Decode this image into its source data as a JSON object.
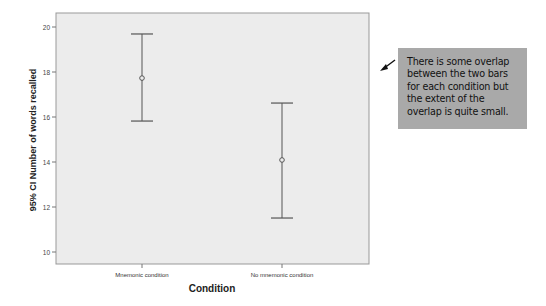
{
  "chart_data": {
    "type": "errorbar",
    "title": "",
    "xlabel": "Condition",
    "ylabel": "95% CI Number of words recalled",
    "ylim": [
      9.5,
      20.5
    ],
    "yticks": [
      10,
      12,
      14,
      16,
      18,
      20
    ],
    "grid": false,
    "categories": [
      "Mnemonic condition",
      "No mnemonic condition"
    ],
    "means": [
      17.73,
      14.09
    ],
    "ci_lower": [
      15.82,
      11.51
    ],
    "ci_upper": [
      19.69,
      16.62
    ],
    "annotation": {
      "text_lines": [
        "There is some overlap",
        "between the two bars",
        "for each condition but",
        "the extent of the",
        "overlap is quite small."
      ],
      "arrow": "pointing left toward plot"
    }
  },
  "colors": {
    "plot_bg": "#ececec",
    "axis": "#888888",
    "errorbar": "#555555",
    "note_bg": "#a9a9a9"
  }
}
